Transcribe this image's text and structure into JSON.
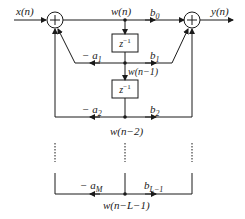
{
  "diagram": {
    "input_label": "x(n)",
    "output_label": "y(n)",
    "state_labels": [
      "w(n)",
      "w(n−1)",
      "w(n−2)",
      "w(n−L−1)"
    ],
    "delay_label": "z",
    "delay_exp": "−1",
    "feedback_coeffs": [
      {
        "sign": "−",
        "base": "a",
        "sub": "1"
      },
      {
        "sign": "−",
        "base": "a",
        "sub": "2"
      },
      {
        "sign": "−",
        "base": "a",
        "sub": "M"
      }
    ],
    "feedforward_coeffs": [
      {
        "base": "b",
        "sub": "0"
      },
      {
        "base": "b",
        "sub": "1"
      },
      {
        "base": "b",
        "sub": "2"
      },
      {
        "base": "b",
        "sub": "L−1"
      }
    ],
    "colors": {
      "line": "#1a1a1a",
      "background": "#ffffff"
    }
  }
}
